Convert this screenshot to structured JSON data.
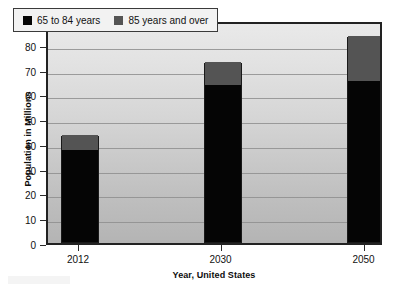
{
  "chart_data": {
    "type": "bar",
    "subtype": "stacked",
    "title": "",
    "xlabel": "Year, United States",
    "ylabel": "Population in Millions",
    "categories": [
      "2012",
      "2030",
      "2050"
    ],
    "series": [
      {
        "name": "65 to 84 years",
        "color": "#050505",
        "values": [
          37,
          63.5,
          65
        ]
      },
      {
        "name": "85 years and over",
        "color": "#545454",
        "values": [
          6,
          9,
          18
        ]
      }
    ],
    "totals": [
      43,
      72.5,
      83
    ],
    "ylim": [
      0,
      90
    ],
    "ytick_step": 10,
    "yticks": [
      "0",
      "10",
      "20",
      "30",
      "40",
      "50",
      "60",
      "70",
      "80",
      "90"
    ],
    "grid": true,
    "legend_position": "top-left",
    "plot_background": "#d2d2d2",
    "plot_border_color": "#222222"
  },
  "legend": {
    "entries": [
      {
        "label": "65 to 84 years",
        "color": "#050505"
      },
      {
        "label": "85 years and over",
        "color": "#545454"
      }
    ]
  }
}
